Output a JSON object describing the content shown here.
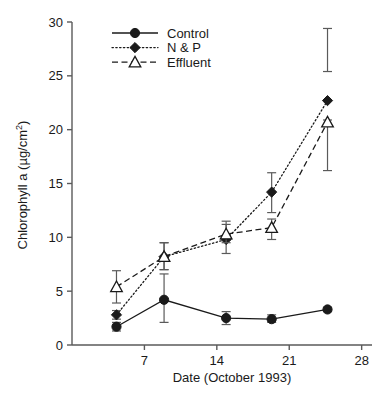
{
  "chart_data": {
    "type": "line",
    "title": "",
    "xlabel": "Date (October 1993)",
    "ylabel": "Chlorophyll a (µg/cm²)",
    "ylabel_base": "Chlorophyll a (µg/cm",
    "ylabel_sup": "2",
    "ylabel_tail": ")",
    "xlim": [
      0,
      29
    ],
    "ylim": [
      0,
      30
    ],
    "xticks": [
      7,
      14,
      21,
      28
    ],
    "xtick_labels": [
      "7",
      "14",
      "21",
      "28"
    ],
    "yticks": [
      0,
      5,
      10,
      15,
      20,
      25,
      30
    ],
    "ytick_labels": [
      "0",
      "5",
      "10",
      "15",
      "20",
      "25",
      "30"
    ],
    "grid": false,
    "legend_position": "top-left",
    "x": [
      4.3,
      8.9,
      14.9,
      19.3,
      24.7
    ],
    "series": [
      {
        "name": "Control",
        "marker": "filled-circle",
        "line": "solid",
        "values": [
          1.7,
          4.2,
          2.5,
          2.4,
          3.3
        ],
        "err_low": [
          1.3,
          2.1,
          1.9,
          2.1,
          3.1
        ],
        "err_high": [
          2.1,
          6.6,
          3.1,
          2.8,
          3.5
        ]
      },
      {
        "name": "N & P",
        "marker": "filled-diamond",
        "line": "dotted",
        "values": [
          2.8,
          8.2,
          9.8,
          14.2,
          22.7
        ],
        "err_low": [
          2.4,
          7.0,
          8.5,
          12.3,
          25.4
        ],
        "err_high": [
          3.2,
          9.5,
          11.2,
          16.0,
          29.4
        ]
      },
      {
        "name": "Effluent",
        "marker": "open-triangle",
        "line": "dashed",
        "values": [
          5.4,
          8.2,
          10.3,
          10.9,
          20.7
        ],
        "err_low": [
          3.9,
          7.0,
          9.5,
          9.8,
          16.2
        ],
        "err_high": [
          6.9,
          9.5,
          11.5,
          11.7,
          20.9
        ]
      }
    ],
    "legend": [
      {
        "label": "Control",
        "marker": "filled-circle",
        "line": "solid"
      },
      {
        "label": "N & P",
        "marker": "filled-diamond",
        "line": "dotted"
      },
      {
        "label": "Effluent",
        "marker": "open-triangle",
        "line": "dashed"
      }
    ],
    "colors": {
      "ink": "#1a1a1a",
      "axis": "#5a5a5a",
      "background": "#ffffff"
    }
  }
}
